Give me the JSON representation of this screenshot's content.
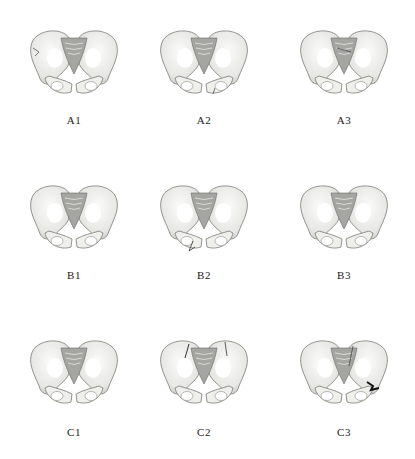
{
  "figure": {
    "panels": [
      {
        "id": "A1",
        "label": "A1",
        "row": "A",
        "col": 1,
        "fracture": "iliac-wing-left"
      },
      {
        "id": "A2",
        "label": "A2",
        "row": "A",
        "col": 2,
        "fracture": "pubic-ramus-right"
      },
      {
        "id": "A3",
        "label": "A3",
        "row": "A",
        "col": 3,
        "fracture": "sacral"
      },
      {
        "id": "B1",
        "label": "B1",
        "row": "B",
        "col": 1,
        "fracture": "sacroiliac"
      },
      {
        "id": "B2",
        "label": "B2",
        "row": "B",
        "col": 2,
        "fracture": "pubic-ramus-left"
      },
      {
        "id": "B3",
        "label": "B3",
        "row": "B",
        "col": 3,
        "fracture": "symphysis"
      },
      {
        "id": "C1",
        "label": "C1",
        "row": "C",
        "col": 1,
        "fracture": "sacral-vertical"
      },
      {
        "id": "C2",
        "label": "C2",
        "row": "C",
        "col": 2,
        "fracture": "bilateral-iliac"
      },
      {
        "id": "C3",
        "label": "C3",
        "row": "C",
        "col": 3,
        "fracture": "acetabular-right"
      }
    ],
    "colors": {
      "bone": "#f4f4f2",
      "bone_shade": "#b8b8b4",
      "outline": "#6a6a66",
      "sacrum": "#9a9a96",
      "fracture": "#1a1a1a",
      "label": "#222222"
    }
  }
}
